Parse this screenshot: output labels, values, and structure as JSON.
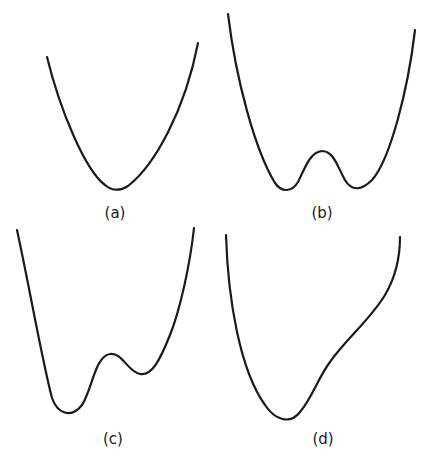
{
  "figure": {
    "panels": [
      {
        "id": "a",
        "label": "(a)",
        "description": "single-well potential"
      },
      {
        "id": "b",
        "label": "(b)",
        "description": "symmetric double-well potential"
      },
      {
        "id": "c",
        "label": "(c)",
        "description": "asymmetric double-well potential"
      },
      {
        "id": "d",
        "label": "(d)",
        "description": "single well with shoulder"
      }
    ],
    "stroke_color": "#1a1a1a",
    "background_color": "#ffffff"
  }
}
